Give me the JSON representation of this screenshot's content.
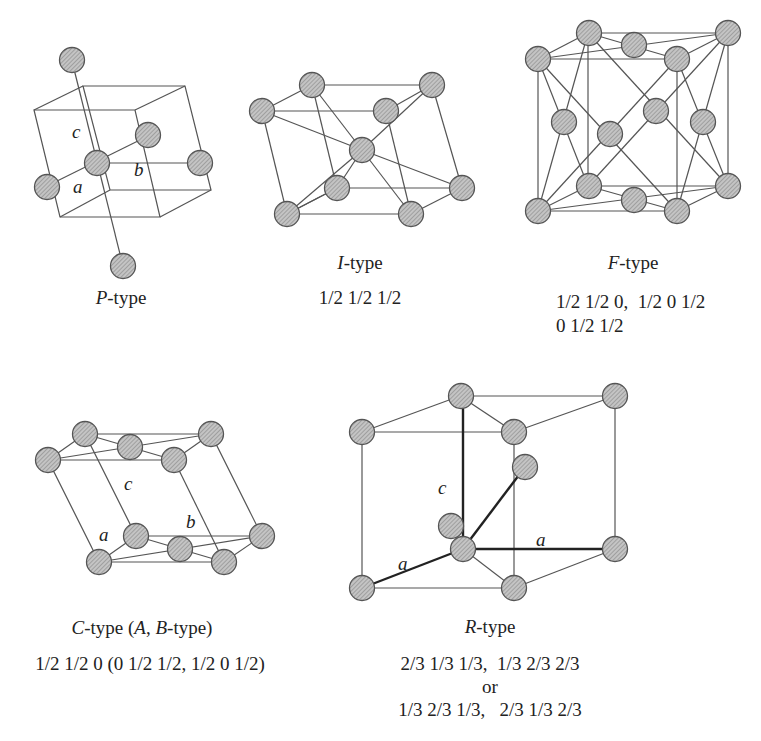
{
  "figure": {
    "panels": [
      {
        "id": "P",
        "letter": "P",
        "suffix": "-type",
        "positions": [],
        "axes": {
          "a": "a",
          "b": "b",
          "c": "c"
        }
      },
      {
        "id": "I",
        "letter": "I",
        "suffix": "-type",
        "positions": [
          "1/2 1/2 1/2"
        ]
      },
      {
        "id": "F",
        "letter": "F",
        "suffix": "-type",
        "positions": [
          "1/2 1/2 0,  1/2 0 1/2",
          "0 1/2 1/2"
        ]
      },
      {
        "id": "C",
        "letter": "C",
        "suffix": "-type (",
        "letter2": "A",
        "mid": ", ",
        "letter3": "B",
        "suffix2": "-type)",
        "positions": [
          "1/2 1/2 0 (0 1/2 1/2, 1/2 0 1/2)"
        ],
        "axes": {
          "a": "a",
          "b": "b",
          "c": "c"
        }
      },
      {
        "id": "R",
        "letter": "R",
        "suffix": "-type",
        "positions": [
          "2/3 1/3 1/3,  1/3 2/3 2/3",
          "or",
          "1/3 2/3 1/3,   2/3 1/3 2/3"
        ],
        "axes": {
          "a1": "a",
          "a2": "a",
          "c": "c"
        }
      }
    ],
    "colors": {
      "line": "#555555",
      "atom_fill": "#bdbdbd",
      "atom_stroke": "#555555",
      "bold_line": "#222222"
    }
  }
}
